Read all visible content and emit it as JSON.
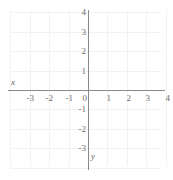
{
  "chart_data": {
    "type": "scatter",
    "title": "",
    "xlabel": "x",
    "ylabel": "y",
    "xlim": [
      -3.9,
      4.3
    ],
    "ylim": [
      -3.6,
      4.2
    ],
    "grid": true,
    "legend": null,
    "series": [],
    "x_ticks": [
      -3,
      -2,
      -1,
      0,
      1,
      2,
      3,
      4
    ],
    "y_ticks": [
      4,
      3,
      2,
      1,
      -1,
      -2,
      -3
    ],
    "x_tick_labels": [
      "-3",
      "-2",
      "-1",
      "0",
      "1",
      "2",
      "3",
      "4"
    ],
    "y_tick_labels": [
      "4",
      "3",
      "2",
      "1",
      "-1",
      "-2",
      "-3"
    ],
    "origin_label": "0",
    "annotations": []
  },
  "axes": {
    "x_axis_name": "x",
    "y_axis_name": "y"
  },
  "style": {
    "axis_color": "#8a8a8a",
    "grid_color": "#f2f2f2",
    "tick_text_color": "#6d6d6d",
    "label_text_color": "#5f5f5f",
    "background": "#ffffff"
  },
  "geometry": {
    "origin_x": 88,
    "origin_y": 90,
    "unit_px": 19.4
  }
}
